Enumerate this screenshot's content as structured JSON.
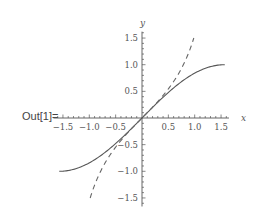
{
  "cell": {
    "output_label": "Out[1]="
  },
  "chart_data": {
    "type": "line",
    "title": "",
    "xlabel": "x",
    "ylabel": "y",
    "xlim": [
      -1.5708,
      1.5708
    ],
    "ylim": [
      -1.6,
      1.6
    ],
    "grid": false,
    "legend": null,
    "x_ticks": [
      "-1.5",
      "-1.0",
      "-0.5",
      "0.5",
      "1.0",
      "1.5"
    ],
    "y_ticks": [
      "1.5",
      "1.0",
      "0.5",
      "-0.5",
      "-1.0",
      "-1.5"
    ],
    "series": [
      {
        "name": "sin(x)",
        "style": "solid",
        "color": "#555555",
        "x": [
          -1.5708,
          -1.25,
          -1.0,
          -0.75,
          -0.5,
          -0.25,
          0,
          0.25,
          0.5,
          0.75,
          1.0,
          1.25,
          1.5708
        ],
        "values": [
          -1.0,
          -0.949,
          -0.841,
          -0.682,
          -0.479,
          -0.247,
          0,
          0.247,
          0.479,
          0.682,
          0.841,
          0.949,
          1.0
        ]
      },
      {
        "name": "tan(x)",
        "style": "dashed",
        "color": "#666666",
        "x": [
          -0.983,
          -0.75,
          -0.5,
          -0.25,
          0,
          0.25,
          0.5,
          0.75,
          0.983
        ],
        "values": [
          -1.5,
          -0.932,
          -0.546,
          -0.255,
          0,
          0.255,
          0.546,
          0.932,
          1.5
        ]
      }
    ]
  }
}
